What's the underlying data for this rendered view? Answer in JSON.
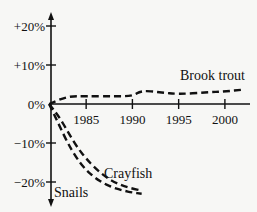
{
  "chart_data": {
    "type": "line",
    "title": "",
    "xlabel": "",
    "ylabel": "",
    "x_ticks": [
      "1985",
      "1990",
      "1995",
      "2000"
    ],
    "y_ticks": [
      "+20%",
      "+10%",
      "0%",
      "−10%",
      "−20%"
    ],
    "xlim": [
      1981,
      2003
    ],
    "ylim": [
      -25,
      24
    ],
    "grid": false,
    "legend": "inline labels",
    "line_style": "dashed",
    "series": [
      {
        "name": "Brook trout",
        "x": [
          1981,
          1983,
          1985,
          1988,
          1990,
          1991,
          1993,
          1995,
          1998,
          2000,
          2002
        ],
        "values": [
          0,
          2,
          2,
          2,
          2,
          3.5,
          3,
          2.5,
          3,
          3.2,
          3.7
        ]
      },
      {
        "name": "Crayfish",
        "x": [
          1981,
          1982,
          1983,
          1984,
          1985,
          1986,
          1987,
          1988,
          1989,
          1990,
          1991
        ],
        "values": [
          0,
          -3,
          -7,
          -11,
          -14,
          -16.5,
          -18.5,
          -20,
          -21,
          -21.7,
          -22.2
        ]
      },
      {
        "name": "Snails",
        "x": [
          1981,
          1982,
          1983,
          1984,
          1985,
          1986,
          1987,
          1988,
          1989,
          1990,
          1991
        ],
        "values": [
          0,
          -5,
          -10,
          -14,
          -17,
          -19,
          -20.5,
          -21.5,
          -22.2,
          -22.7,
          -23
        ]
      }
    ]
  }
}
